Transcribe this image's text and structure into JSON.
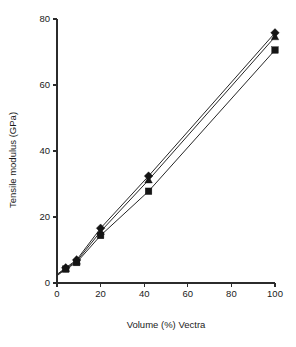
{
  "figure": {
    "background": "#ffffff",
    "ink_color": "#1a1a1a"
  },
  "chart_data": {
    "type": "line",
    "title": "",
    "subtitle": "",
    "xlabel": "Volume (%) Vectra",
    "ylabel": "Tensile modulus (GPa)",
    "xlim": [
      0,
      100
    ],
    "ylim": [
      0,
      80
    ],
    "xticks": [
      0,
      20,
      40,
      60,
      80,
      100
    ],
    "yticks": [
      0,
      20,
      40,
      60,
      80
    ],
    "xticklabels": [
      "0",
      "20",
      "40",
      "60",
      "80",
      "100"
    ],
    "yticklabels": [
      "0",
      "20",
      "40",
      "60",
      "80"
    ],
    "grid": false,
    "legend": null,
    "legend_position": "none",
    "annotations": [],
    "series": [
      {
        "name": "series-1",
        "marker": "diamond",
        "color": "#151515",
        "x": [
          0,
          4,
          9,
          20,
          42,
          100
        ],
        "y": [
          2.6,
          4.6,
          7.0,
          16.6,
          32.4,
          75.8
        ]
      },
      {
        "name": "series-2",
        "marker": "triangle",
        "color": "#151515",
        "x": [
          0,
          4,
          9,
          20,
          42,
          100
        ],
        "y": [
          2.4,
          4.4,
          6.6,
          15.6,
          31.2,
          74.6
        ]
      },
      {
        "name": "series-3",
        "marker": "square",
        "color": "#151515",
        "x": [
          0,
          4,
          9,
          20,
          42,
          100
        ],
        "y": [
          2.2,
          4.2,
          6.2,
          14.4,
          27.8,
          70.6
        ]
      }
    ]
  }
}
